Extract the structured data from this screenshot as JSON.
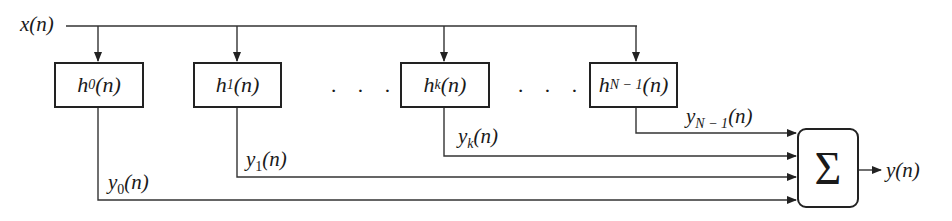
{
  "input": {
    "label": "x(n)"
  },
  "filters": [
    {
      "name": "h",
      "sub": "0",
      "arg": "(n)",
      "output": {
        "name": "y",
        "sub": "0",
        "arg": "(n)"
      }
    },
    {
      "name": "h",
      "sub": "1",
      "arg": "(n)",
      "output": {
        "name": "y",
        "sub": "1",
        "arg": "(n)"
      }
    },
    {
      "name": "h",
      "sub": "k",
      "arg": "(n)",
      "output": {
        "name": "y",
        "sub": "k",
        "arg": "(n)"
      }
    },
    {
      "name": "h",
      "sub": "N − 1",
      "arg": "(n)",
      "output": {
        "name": "y",
        "sub": "N − 1",
        "arg": "(n)"
      }
    }
  ],
  "ellipsis": "· · ·",
  "summer": {
    "symbol": "Σ"
  },
  "output": {
    "label": "y(n)"
  },
  "colors": {
    "line": "#222222",
    "background": "#ffffff"
  }
}
